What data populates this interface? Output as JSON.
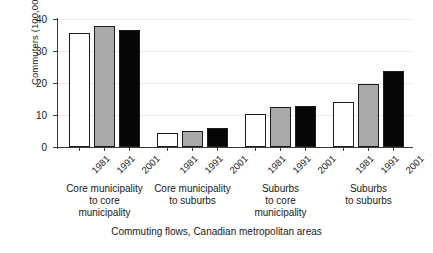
{
  "chart_data": {
    "type": "bar",
    "title": "",
    "xlabel": "Commuting flows, Canadian metropolitan areas",
    "ylabel": "Commuters (100,000s)",
    "ylim": [
      0,
      40
    ],
    "yticks": [
      0,
      10,
      20,
      30,
      40
    ],
    "ytick_labels": [
      "0",
      "10",
      "20",
      "30",
      "40"
    ],
    "grid": true,
    "grid_axis": "y",
    "legend": "none",
    "categories": [
      "Core municipality to core municipality",
      "Core municipality to suburbs",
      "Suburbs to core municipality",
      "Suburbs to suburbs"
    ],
    "category_lines": [
      "Core municipality\nto core\nmunicipality",
      "Core municipality\nto suburbs",
      "Suburbs\nto core\nmunicipality",
      "Suburbs\nto suburbs"
    ],
    "subcategories": [
      "1981",
      "1991",
      "2001"
    ],
    "series": [
      {
        "name": "1981",
        "color": "#ffffff",
        "values": [
          35.6,
          4.3,
          10.3,
          14.1
        ]
      },
      {
        "name": "1991",
        "color": "#a9a9a9",
        "values": [
          37.7,
          5.0,
          12.6,
          19.6
        ]
      },
      {
        "name": "2001",
        "color": "#060606",
        "values": [
          36.6,
          6.0,
          12.8,
          23.6
        ]
      }
    ],
    "groups": [
      {
        "caption": "Core municipality\nto core\nmunicipality",
        "bars": [
          {
            "year": "1981",
            "value": 35.6,
            "fill": "#ffffff"
          },
          {
            "year": "1991",
            "value": 37.7,
            "fill": "#a9a9a9"
          },
          {
            "year": "2001",
            "value": 36.6,
            "fill": "#060606"
          }
        ]
      },
      {
        "caption": "Core municipality\nto suburbs",
        "bars": [
          {
            "year": "1981",
            "value": 4.3,
            "fill": "#ffffff"
          },
          {
            "year": "1991",
            "value": 5.0,
            "fill": "#a9a9a9"
          },
          {
            "year": "2001",
            "value": 6.0,
            "fill": "#060606"
          }
        ]
      },
      {
        "caption": "Suburbs\nto core\nmunicipality",
        "bars": [
          {
            "year": "1981",
            "value": 10.3,
            "fill": "#ffffff"
          },
          {
            "year": "1991",
            "value": 12.6,
            "fill": "#a9a9a9"
          },
          {
            "year": "2001",
            "value": 12.8,
            "fill": "#060606"
          }
        ]
      },
      {
        "caption": "Suburbs\nto suburbs",
        "bars": [
          {
            "year": "1981",
            "value": 14.1,
            "fill": "#ffffff"
          },
          {
            "year": "1991",
            "value": 19.6,
            "fill": "#a9a9a9"
          },
          {
            "year": "2001",
            "value": 23.6,
            "fill": "#060606"
          }
        ]
      }
    ]
  },
  "colors": {
    "axis": "#3b3b3b",
    "grid": "#ededed",
    "bar_edge": "#1d1d1d",
    "background": "#ffffff",
    "text": "#1a1a1a"
  }
}
